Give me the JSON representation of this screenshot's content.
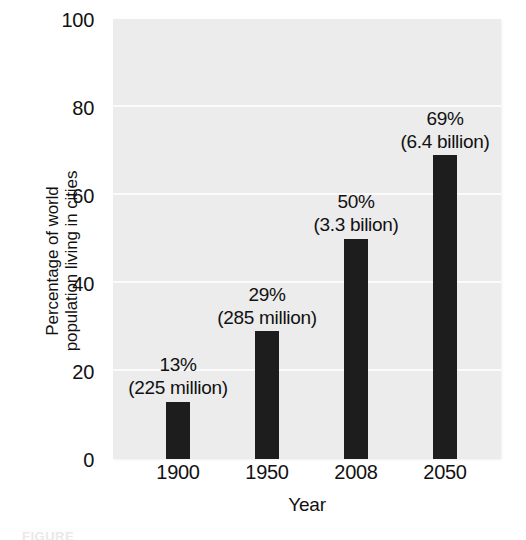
{
  "chart_data": {
    "type": "bar",
    "title": "",
    "subtitle": "",
    "xlabel": "Year",
    "ylabel": "Percentage of world population living in cities",
    "ylabel_lines": [
      "Percentage of world",
      "population living in cities"
    ],
    "categories": [
      "1900",
      "1950",
      "2008",
      "2050"
    ],
    "values": [
      13,
      29,
      50,
      69
    ],
    "ylim": [
      0,
      100
    ],
    "yticks": [
      0,
      20,
      40,
      60,
      80,
      100
    ],
    "ytick_labels": [
      "0",
      "20",
      "40",
      "60",
      "80",
      "100"
    ],
    "grid": "horizontal",
    "legend": "none",
    "bar_color": "#1d1d1d",
    "plot_background": "#ececec",
    "gridline_color": "#fbfbfb",
    "annotations": [
      {
        "percent": "13%",
        "absolute": "(225 million)"
      },
      {
        "percent": "29%",
        "absolute": "(285 million)"
      },
      {
        "percent": "50%",
        "absolute": "(3.3 bilion)"
      },
      {
        "percent": "69%",
        "absolute": "(6.4 billion)"
      }
    ]
  },
  "caption": {
    "text": "FIGURE"
  }
}
